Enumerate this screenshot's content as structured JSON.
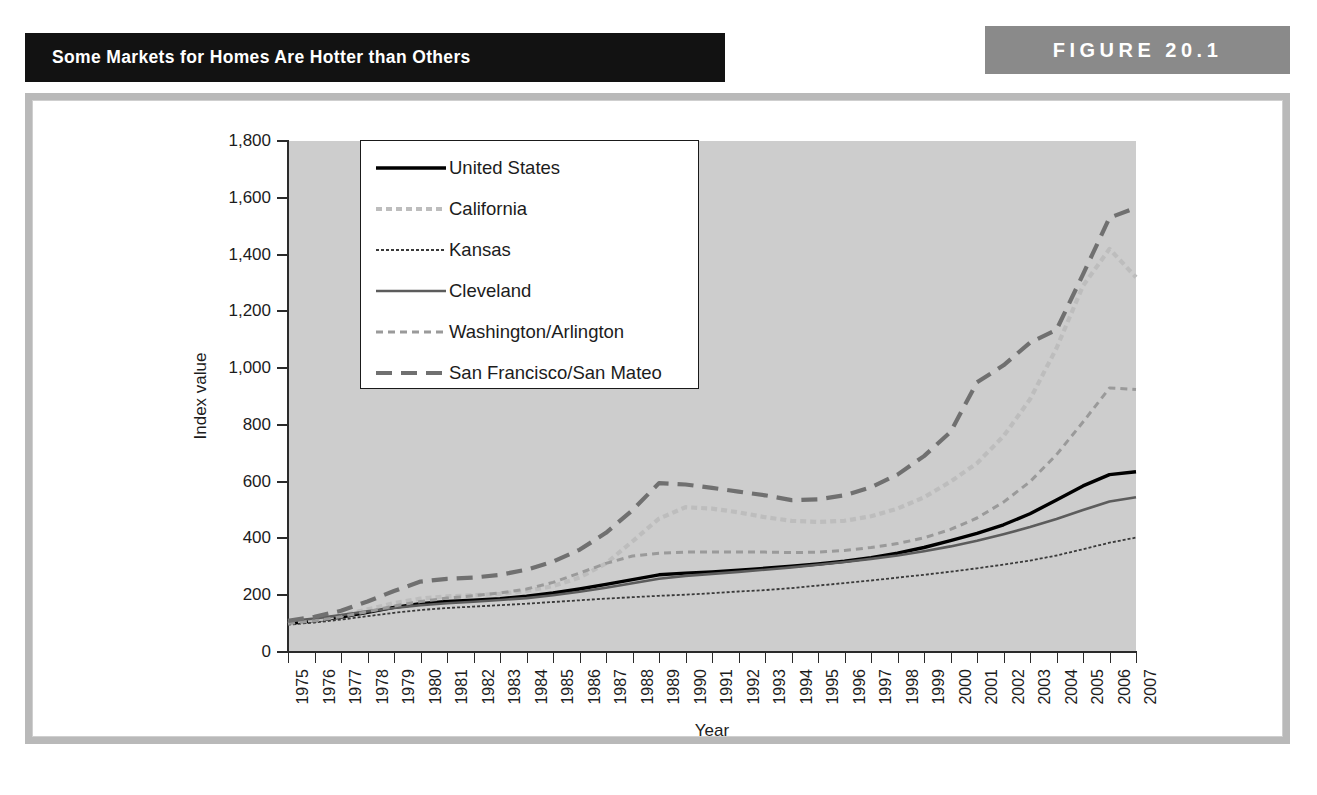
{
  "header": {
    "title": "Some Markets for Homes Are Hotter than Others",
    "figure_label": "FIGURE 20.1",
    "title_bar_color": "#121212",
    "figure_bar_color": "#8a8a8a"
  },
  "frame": {
    "border_color": "#b9b9b9"
  },
  "chart_data": {
    "type": "line",
    "title": "Some Markets for Homes Are Hotter than Others",
    "xlabel": "Year",
    "ylabel": "Index value",
    "ylim": [
      0,
      1800
    ],
    "ytick_step": 200,
    "ytick_labels": [
      "0",
      "200",
      "400",
      "600",
      "800",
      "1,000",
      "1,200",
      "1,400",
      "1,600",
      "1,800"
    ],
    "ytick_values": [
      0,
      200,
      400,
      600,
      800,
      1000,
      1200,
      1400,
      1600,
      1800
    ],
    "grid": false,
    "plot_background": "#cdcdcd",
    "legend_position": "upper-left-inside",
    "categories": [
      1975,
      1976,
      1977,
      1978,
      1979,
      1980,
      1981,
      1982,
      1983,
      1984,
      1985,
      1986,
      1987,
      1988,
      1989,
      1990,
      1991,
      1992,
      1993,
      1994,
      1995,
      1996,
      1997,
      1998,
      1999,
      2000,
      2001,
      2002,
      2003,
      2004,
      2005,
      2006,
      2007
    ],
    "x": [
      "1975",
      "1976",
      "1977",
      "1978",
      "1979",
      "1980",
      "1981",
      "1982",
      "1983",
      "1984",
      "1985",
      "1986",
      "1987",
      "1988",
      "1989",
      "1990",
      "1991",
      "1992",
      "1993",
      "1994",
      "1995",
      "1996",
      "1997",
      "1998",
      "1999",
      "2000",
      "2001",
      "2002",
      "2003",
      "2004",
      "2005",
      "2006",
      "2007"
    ],
    "series": [
      {
        "name": "United States",
        "color": "#000000",
        "width": 3.4,
        "dash": "none",
        "values": [
          100,
          110,
          123,
          140,
          157,
          170,
          178,
          182,
          188,
          197,
          208,
          222,
          238,
          255,
          272,
          278,
          282,
          288,
          295,
          302,
          310,
          320,
          332,
          348,
          368,
          392,
          418,
          448,
          487,
          535,
          585,
          625,
          635
        ]
      },
      {
        "name": "California",
        "color": "#bdbdbd",
        "width": 4.2,
        "dash": "6 4",
        "values": [
          100,
          112,
          128,
          150,
          172,
          188,
          196,
          200,
          205,
          215,
          232,
          262,
          312,
          390,
          470,
          510,
          505,
          492,
          475,
          462,
          458,
          462,
          478,
          505,
          545,
          600,
          665,
          760,
          890,
          1070,
          1290,
          1420,
          1320
        ]
      },
      {
        "name": "Kansas",
        "color": "#3a3a3a",
        "width": 1.8,
        "dash": "3 2",
        "values": [
          96,
          104,
          114,
          126,
          138,
          148,
          155,
          160,
          165,
          170,
          176,
          182,
          188,
          193,
          198,
          202,
          207,
          213,
          218,
          225,
          234,
          243,
          252,
          262,
          272,
          283,
          295,
          308,
          322,
          340,
          362,
          385,
          403
        ]
      },
      {
        "name": "Cleveland",
        "color": "#5c5c5c",
        "width": 2.6,
        "dash": "none",
        "values": [
          108,
          118,
          130,
          143,
          155,
          165,
          172,
          177,
          183,
          190,
          200,
          212,
          226,
          242,
          258,
          268,
          275,
          282,
          290,
          298,
          307,
          317,
          328,
          340,
          355,
          372,
          392,
          415,
          440,
          468,
          500,
          530,
          545
        ]
      },
      {
        "name": "Washington/Arlington",
        "color": "#9a9a9a",
        "width": 3.0,
        "dash": "7 5",
        "values": [
          100,
          110,
          124,
          142,
          162,
          178,
          190,
          198,
          208,
          222,
          245,
          278,
          312,
          338,
          348,
          352,
          352,
          352,
          352,
          350,
          352,
          358,
          368,
          382,
          402,
          432,
          472,
          528,
          600,
          695,
          810,
          930,
          925
        ]
      },
      {
        "name": "San Francisco/San Mateo",
        "color": "#707070",
        "width": 4.2,
        "dash": "16 9",
        "values": [
          110,
          124,
          145,
          178,
          215,
          248,
          258,
          262,
          272,
          290,
          318,
          360,
          420,
          500,
          595,
          590,
          578,
          565,
          552,
          535,
          538,
          552,
          580,
          625,
          690,
          775,
          950,
          1010,
          1090,
          1135,
          1330,
          1530,
          1565
        ]
      }
    ]
  },
  "legend": {
    "entries": [
      {
        "label": "United States"
      },
      {
        "label": "California"
      },
      {
        "label": "Kansas"
      },
      {
        "label": "Cleveland"
      },
      {
        "label": "Washington/Arlington"
      },
      {
        "label": "San Francisco/San Mateo"
      }
    ]
  }
}
